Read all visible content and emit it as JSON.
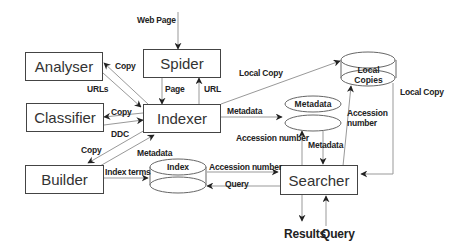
{
  "diagram": {
    "components": {
      "spider": "Spider",
      "analyser": "Analyser",
      "classifier": "Classifier",
      "indexer": "Indexer",
      "builder": "Builder",
      "searcher": "Searcher"
    },
    "stores": {
      "index": "Index",
      "metadata": "Metadata",
      "local_copies_line1": "Local",
      "local_copies_line2": "Copies"
    },
    "labels": {
      "web_page": "Web Page",
      "copy_analyser": "Copy",
      "urls": "URLs",
      "page": "Page",
      "url": "URL",
      "local_copy_top": "Local Copy",
      "copy_classifier": "Copy",
      "ddc": "DDC",
      "metadata_indexer": "Metadata",
      "copy_builder": "Copy",
      "metadata_builder": "Metadata",
      "index_terms": "Index terms",
      "accession_number_index": "Accession number",
      "query_index": "Query",
      "accession_number_meta": "Accession number",
      "metadata_searcher": "Metadata",
      "accession_number_local_line1": "Accession",
      "accession_number_local_line2": "number",
      "local_copy_right": "Local Copy",
      "results": "Results",
      "query_bottom": "Query"
    }
  }
}
